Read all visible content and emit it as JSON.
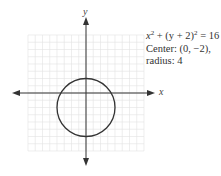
{
  "figure": {
    "axis_labels": {
      "x": "x",
      "y": "y"
    },
    "equation": {
      "line1": {
        "x_term": "x",
        "exp1": "2",
        "mid": " + (y + 2)",
        "exp2": "2",
        "rhs": " = 16"
      },
      "line2": "Center: (0, −2),",
      "line3": "radius: 4"
    },
    "colors": {
      "grid": "#e3e3e3",
      "axis": "#333333",
      "circle": "#333333",
      "text": "#333333"
    }
  },
  "chart_data": {
    "type": "line",
    "annotations": [
      "Center: (0, −2),",
      "radius: 4"
    ],
    "xlabel": "x",
    "ylabel": "y",
    "xlim": [
      -8,
      8
    ],
    "ylim": [
      -8,
      8
    ],
    "grid": true,
    "series": [
      {
        "name": "circle",
        "shape": "circle",
        "center": [
          0,
          -2
        ],
        "radius": 4,
        "key_points": [
          [
            0,
            2
          ],
          [
            0,
            -6
          ],
          [
            -4,
            -2
          ],
          [
            4,
            -2
          ]
        ]
      }
    ]
  }
}
